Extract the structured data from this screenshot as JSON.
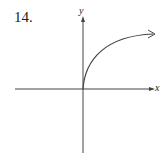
{
  "problem_number": "14.",
  "axes": {
    "x_label": "x",
    "y_label": "y"
  },
  "curve": {
    "description": "increasing concave-down curve starting at origin, approaching horizontal asymptote, arrow to the right"
  },
  "colors": {
    "ink": "#444444"
  }
}
